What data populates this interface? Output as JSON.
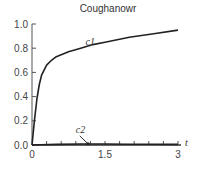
{
  "chart_data": {
    "type": "line",
    "title": "Coughanowr",
    "xlabel": "t",
    "ylabel": "",
    "xlim": [
      0,
      3
    ],
    "ylim": [
      0,
      1.0
    ],
    "x_ticks": [
      0,
      1.5,
      3
    ],
    "x_tick_labels": [
      "0",
      "1.5",
      "3"
    ],
    "x_minor_tick_step": 0.3,
    "y_ticks": [
      0.0,
      0.2,
      0.4,
      0.6,
      0.8,
      1.0
    ],
    "y_tick_labels": [
      "0.0",
      "0.2",
      "0.4",
      "0.6",
      "0.8",
      "1.0"
    ],
    "grid": false,
    "legend": "inline labels",
    "series": [
      {
        "name": "c1",
        "x": [
          0,
          0.05,
          0.1,
          0.15,
          0.2,
          0.3,
          0.4,
          0.5,
          0.75,
          1.0,
          1.25,
          1.5,
          2.0,
          2.5,
          3.0
        ],
        "values": [
          0,
          0.2,
          0.38,
          0.5,
          0.58,
          0.66,
          0.7,
          0.73,
          0.77,
          0.8,
          0.83,
          0.85,
          0.89,
          0.92,
          0.95
        ]
      },
      {
        "name": "c2",
        "x": [
          0,
          0.5,
          1.0,
          1.5,
          2.0,
          2.5,
          3.0
        ],
        "values": [
          0,
          0.005,
          0.008,
          0.008,
          0.007,
          0.006,
          0.005
        ]
      }
    ],
    "annotations": [
      {
        "text": "c1",
        "x": 1.1,
        "y": 0.83
      },
      {
        "text": "c2",
        "x": 0.9,
        "y": 0.1,
        "arrow_to": [
          1.15,
          0.01
        ]
      }
    ]
  }
}
